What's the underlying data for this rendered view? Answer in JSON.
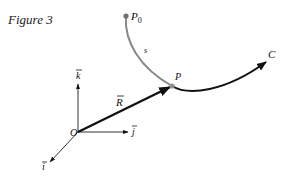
{
  "figure": {
    "title": "Figure 3"
  },
  "labels": {
    "p0": "P",
    "p0_sub": "0",
    "p": "P",
    "s": "s",
    "c": "C",
    "r": "R",
    "o": "O",
    "k": "k",
    "j": "j",
    "i": "i"
  },
  "colors": {
    "ink": "#111111",
    "arc_gray": "#808080",
    "point_gray": "#707070"
  }
}
